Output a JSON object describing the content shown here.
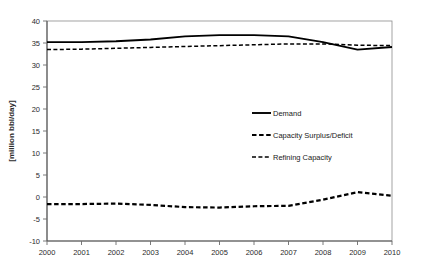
{
  "chart_data": {
    "type": "line",
    "title": "",
    "subtitle": "",
    "xlabel": "",
    "ylabel": "[million bbl/day]",
    "categories": [
      "2000",
      "2001",
      "2002",
      "2003",
      "2004",
      "2005",
      "2006",
      "2007",
      "2008",
      "2009",
      "2010"
    ],
    "x": [
      2000,
      2001,
      2002,
      2003,
      2004,
      2005,
      2006,
      2007,
      2008,
      2009,
      2010
    ],
    "xlim": [
      2000,
      2010
    ],
    "ylim": [
      -10,
      40
    ],
    "yticks": [
      -10,
      -5,
      0,
      5,
      10,
      15,
      20,
      25,
      30,
      35,
      40
    ],
    "ytick_labels": [
      "-10",
      "-5",
      "0",
      "5",
      "10",
      "15",
      "20",
      "25",
      "30",
      "35",
      "40"
    ],
    "grid": false,
    "legend_position": "center-right",
    "series": [
      {
        "name": "Demand",
        "style": "solid",
        "color": "#000000",
        "values": [
          35.2,
          35.2,
          35.4,
          35.8,
          36.5,
          36.8,
          36.8,
          36.5,
          35.2,
          33.5,
          34.1
        ]
      },
      {
        "name": "Capacity Surplus/Deficit",
        "style": "dashed-thick",
        "color": "#000000",
        "values": [
          -1.6,
          -1.6,
          -1.5,
          -1.8,
          -2.3,
          -2.4,
          -2.1,
          -2.0,
          -0.6,
          1.1,
          0.3
        ]
      },
      {
        "name": "Refining Capacity",
        "style": "dashed-thin",
        "color": "#000000",
        "values": [
          33.5,
          33.6,
          33.8,
          34.0,
          34.2,
          34.4,
          34.6,
          34.8,
          34.8,
          34.5,
          34.4
        ]
      }
    ]
  },
  "legend": {
    "items": [
      {
        "label": "Demand",
        "swatch": "solid-line-swatch"
      },
      {
        "label": "Capacity Surplus/Deficit",
        "swatch": "dashed-thick-line-swatch"
      },
      {
        "label": "Refining Capacity",
        "swatch": "dashed-thin-line-swatch"
      }
    ]
  },
  "axes": {
    "y_axis_title": "[million bbl/day]"
  }
}
